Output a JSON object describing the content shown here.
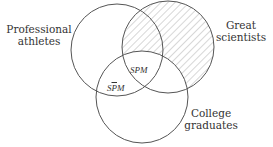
{
  "diagram": {
    "type": "venn-3",
    "sets": [
      {
        "id": "P",
        "label_line1": "Professional",
        "label_line2": "athletes"
      },
      {
        "id": "S",
        "label_line1": "Great",
        "label_line2": "scientists"
      },
      {
        "id": "M",
        "label_line1": "College",
        "label_line2": "graduates"
      }
    ],
    "regions": [
      {
        "id": "SPM",
        "parts": [
          "S",
          "P",
          "M"
        ],
        "negated": []
      },
      {
        "id": "SPbarM",
        "parts": [
          "S",
          "P",
          "M"
        ],
        "negated": [
          "P"
        ]
      }
    ],
    "shaded_region": "S and not M",
    "colors": {
      "stroke": "#555555",
      "hatch": "#aaaaaa",
      "text": "#333333",
      "background": "#ffffff"
    }
  }
}
